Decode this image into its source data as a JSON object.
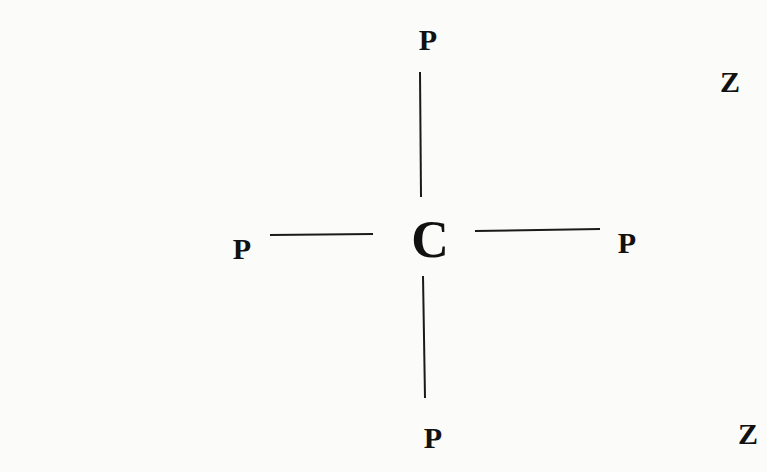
{
  "diagram": {
    "center": {
      "label": "C",
      "x": 430,
      "y": 240
    },
    "nodes": [
      {
        "id": "p-top",
        "label": "P",
        "x": 428,
        "y": 40
      },
      {
        "id": "p-left",
        "label": "P",
        "x": 242,
        "y": 249
      },
      {
        "id": "p-right",
        "label": "P",
        "x": 627,
        "y": 243
      },
      {
        "id": "p-bottom",
        "label": "P",
        "x": 433,
        "y": 438
      }
    ],
    "extra_labels": [
      {
        "id": "z-upper",
        "label": "Z",
        "x": 730,
        "y": 82
      },
      {
        "id": "z-lower",
        "label": "Z",
        "x": 748,
        "y": 434
      }
    ],
    "bonds": [
      {
        "id": "bond-top",
        "x1": 420,
        "y1": 72,
        "x2": 421,
        "y2": 197
      },
      {
        "id": "bond-left",
        "x1": 270,
        "y1": 235,
        "x2": 373,
        "y2": 234
      },
      {
        "id": "bond-right",
        "x1": 475,
        "y1": 231,
        "x2": 600,
        "y2": 229
      },
      {
        "id": "bond-bottom",
        "x1": 423,
        "y1": 276,
        "x2": 425,
        "y2": 398
      }
    ],
    "line_color": "#1a1a1a"
  }
}
